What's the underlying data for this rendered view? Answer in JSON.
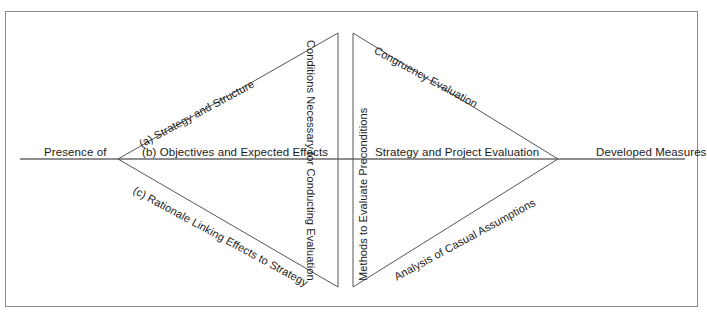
{
  "diagram": {
    "type": "diamond-flow-diagram",
    "colors": {
      "frame": "#8a8a8a",
      "line": "#555555",
      "text": "#1b1b1b",
      "background": "#ffffff"
    },
    "endpoints": {
      "left_label": "Presence of",
      "right_label": "Developed Measures"
    },
    "center_axis": {
      "left_segment_label": "(b) Objectives and Expected Effects",
      "right_segment_label": "Strategy and Project Evaluation"
    },
    "vertical_labels": [
      {
        "id": "conditions",
        "text": "Conditions Necessary for Conducting Evaluation",
        "orientation": "rotated-clockwise"
      },
      {
        "id": "methods",
        "text": "Methods to Evaluate Preconditions",
        "orientation": "rotated-counter-clockwise"
      }
    ],
    "edge_labels": [
      {
        "id": "a",
        "text": "(a) Strategy and Structure",
        "edge": "upper-left"
      },
      {
        "id": "c",
        "text": "(c) Rationale Linking Effects to Strategy",
        "edge": "lower-left"
      },
      {
        "id": "congruency",
        "text": "Congruency Evaluation",
        "edge": "upper-right"
      },
      {
        "id": "analysis",
        "text": "Analysis of Casual Assumptions",
        "edge": "lower-right"
      }
    ],
    "geometry": {
      "left_vertex": [
        118,
        159
      ],
      "right_vertex": [
        558,
        159
      ],
      "top_vertex": [
        338,
        33
      ],
      "bottom_vertex": [
        338,
        287
      ],
      "axis_start_x": 20,
      "axis_end_x": 685,
      "axis_y": 159,
      "divider_x_left": 338,
      "divider_x_right": 353,
      "divider_top_y": 33,
      "divider_bottom_y": 287
    }
  }
}
